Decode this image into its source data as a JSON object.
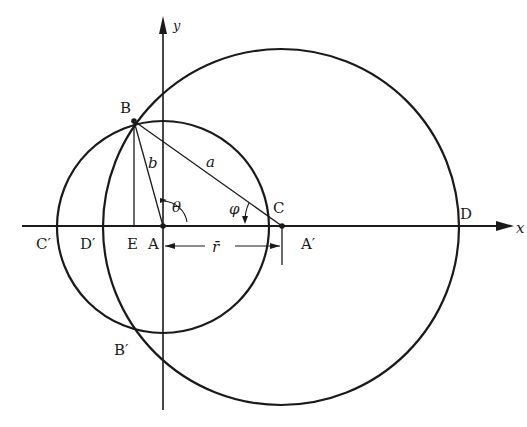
{
  "diagram": {
    "type": "geometric construction",
    "axes": {
      "x_label": "x",
      "y_label": "y"
    },
    "points": {
      "A": "A",
      "A_prime": "A′",
      "B": "B",
      "B_prime": "B′",
      "C": "C",
      "C_prime": "C′",
      "D": "D",
      "D_prime": "D′",
      "E": "E"
    },
    "segments": {
      "a": "a",
      "b": "b",
      "r": "r̄"
    },
    "angles": {
      "theta": "θ",
      "phi": "φ"
    },
    "circles": [
      {
        "name": "small circle",
        "center": "A",
        "passes_through": [
          "B",
          "B′",
          "C′"
        ]
      },
      {
        "name": "large circle",
        "center": "A′",
        "passes_through": [
          "B",
          "B′",
          "D",
          "D′"
        ]
      }
    ],
    "colors": {
      "ink": "#1a1a1a",
      "background": "#ffffff"
    }
  }
}
